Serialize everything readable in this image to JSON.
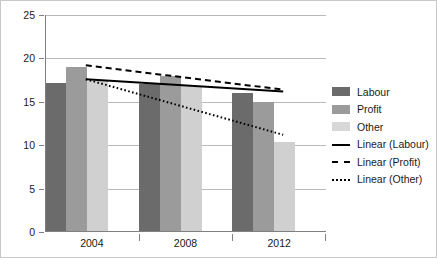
{
  "chart_data": {
    "type": "bar",
    "title": "",
    "subtitle": "",
    "xlabel": "",
    "ylabel": "",
    "categories": [
      "2004",
      "2008",
      "2012"
    ],
    "series": [
      {
        "name": "Labour",
        "color": "#6b6b6b",
        "values": [
          17.2,
          17.0,
          16.0
        ]
      },
      {
        "name": "Profit",
        "color": "#9b9b9b",
        "values": [
          19.0,
          18.0,
          15.0
        ]
      },
      {
        "name": "Other",
        "color": "#d0d0d0",
        "values": [
          17.4,
          16.8,
          10.4
        ]
      }
    ],
    "trendlines": [
      {
        "name": "Linear (Labour)",
        "style": "solid",
        "start": 17.6,
        "end": 16.2
      },
      {
        "name": "Linear (Profit)",
        "style": "dashed",
        "start": 19.2,
        "end": 16.4
      },
      {
        "name": "Linear (Other)",
        "style": "dotted",
        "start": 17.6,
        "end": 11.2
      }
    ],
    "ylim": [
      0,
      25
    ],
    "yticks": [
      0,
      5,
      10,
      15,
      20,
      25
    ],
    "ytick_labels": [
      "0",
      "5",
      "10",
      "15",
      "20",
      "25"
    ],
    "grid": true,
    "legend_position": "right",
    "legend_entries": [
      {
        "label": "Labour",
        "kind": "swatch",
        "series": 0
      },
      {
        "label": "Profit",
        "kind": "swatch",
        "series": 1
      },
      {
        "label": "Other",
        "kind": "swatch",
        "series": 2
      },
      {
        "label": "Linear (Labour)",
        "kind": "line",
        "style": "solid"
      },
      {
        "label": "Linear (Profit)",
        "kind": "line",
        "style": "dashed"
      },
      {
        "label": "Linear (Other)",
        "kind": "line",
        "style": "dotted"
      }
    ]
  }
}
